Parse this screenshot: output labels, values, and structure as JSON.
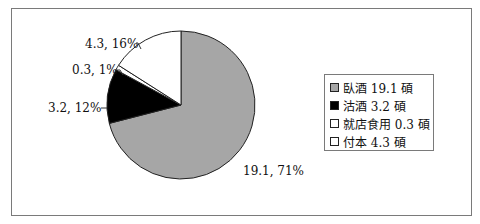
{
  "chart_data": {
    "type": "pie",
    "title": "",
    "unit": "碩",
    "categories": [
      "臥酒",
      "沽酒",
      "就店食用",
      "付本"
    ],
    "values": [
      19.1,
      3.2,
      0.3,
      4.3
    ],
    "percents": [
      71,
      12,
      1,
      16
    ],
    "data_labels": [
      "19.1, 71%",
      "3.2, 12%",
      "0.3, 1%",
      "4.3, 16%"
    ],
    "colors": [
      "#a6a6a6",
      "#000000",
      "#ffffff",
      "#ffffff"
    ],
    "start_angle_deg": 0,
    "direction": "clockwise",
    "legend_position": "right",
    "legend": [
      "臥酒 19.1 碩",
      "沽酒 3.2 碩",
      "就店食用 0.3 碩",
      "付本 4.3 碩"
    ]
  },
  "labels": {
    "slice0": "19.1, 71%",
    "slice1": "3.2, 12%",
    "slice2": "0.3, 1%",
    "slice3": "4.3, 16%"
  },
  "legend": {
    "items": [
      {
        "label": "臥酒 19.1 碩",
        "color": "#a6a6a6"
      },
      {
        "label": "沽酒 3.2 碩",
        "color": "#000000"
      },
      {
        "label": "就店食用 0.3 碩",
        "color": "#ffffff"
      },
      {
        "label": "付本 4.3 碩",
        "color": "#ffffff"
      }
    ]
  }
}
